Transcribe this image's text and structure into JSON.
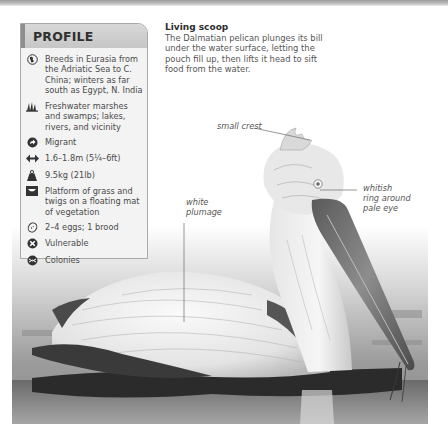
{
  "profile": {
    "title": "PROFILE",
    "items": [
      {
        "icon": "globe-icon",
        "text": "Breeds in Eurasia from the Adriatic Sea to C. China; winters as far south as Egypt, N. India"
      },
      {
        "icon": "marsh-grass-icon",
        "text": "Freshwater marshes and swamps; lakes, rivers, and vicinity"
      },
      {
        "icon": "migrant-arrow-icon",
        "text": "Migrant"
      },
      {
        "icon": "wingspan-icon",
        "text": "1.6–1.8m (5¼–6ft)"
      },
      {
        "icon": "weight-icon",
        "text": "9.5kg (21lb)"
      },
      {
        "icon": "nest-icon",
        "text": "Platform of grass and twigs on a floating mat of vegetation"
      },
      {
        "icon": "egg-icon",
        "text": "2–4 eggs; 1 brood"
      },
      {
        "icon": "status-cross-icon",
        "text": "Vulnerable"
      },
      {
        "icon": "colonies-icon",
        "text": "Colonies"
      }
    ]
  },
  "caption": {
    "title": "Living scoop",
    "body": "The Dalmatian pelican plunges its bill under the water surface, letting the pouch fill up, then lifts it head to sift food from the water."
  },
  "annotations": {
    "crest": "small crest",
    "plumage_line1": "white",
    "plumage_line2": "plumage",
    "eye_line1": "whitish",
    "eye_line2": "ring around",
    "eye_line3": "pale eye"
  },
  "colors": {
    "panel_bg": "#f3f3f3",
    "panel_header": "#cfcfcf",
    "panel_border": "#a9a9a9",
    "icon": "#333333"
  }
}
